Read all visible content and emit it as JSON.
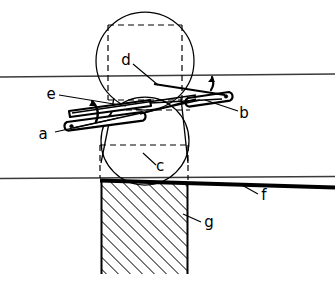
{
  "figure": {
    "background_color": "#ffffff",
    "ink_color": "#000000",
    "width": 335,
    "height": 282,
    "labels": [
      {
        "key": "a",
        "text": "a",
        "x": 45,
        "y": 139,
        "describes": "lower-left lever arm / link with pivot eye"
      },
      {
        "key": "b",
        "text": "b",
        "x": 243,
        "y": 117,
        "describes": "right lever arm / link with pivot eye"
      },
      {
        "key": "c",
        "text": "c",
        "x": 160,
        "y": 170,
        "describes": "lower dashed rectangle inscribed in lower circle"
      },
      {
        "key": "d",
        "text": "d",
        "x": 121,
        "y": 65,
        "describes": "upper dashed rectangle inscribed in upper circle"
      },
      {
        "key": "e",
        "text": "e",
        "x": 50,
        "y": 99,
        "describes": "upper-left lever arm / link"
      },
      {
        "key": "f",
        "text": "f",
        "x": 263,
        "y": 199,
        "describes": "thick horizontal datum line / blade edge"
      },
      {
        "key": "g",
        "text": "g",
        "x": 207,
        "y": 226,
        "describes": "hatched rectangular block / support"
      }
    ],
    "parts": [
      {
        "name": "upper-circle",
        "cx": 145,
        "cy": 61,
        "r": 49
      },
      {
        "name": "lower-circle",
        "cx": 145,
        "cy": 141,
        "r": 44
      },
      {
        "name": "upper-dashed-rectangle",
        "x": 108,
        "y": 25,
        "width": 74,
        "height": 75
      },
      {
        "name": "lower-dashed-rectangle",
        "x": 100,
        "y": 145,
        "width": 88,
        "height": 33
      },
      {
        "name": "band-top-line",
        "x1": 0,
        "y1": 77,
        "x2": 335,
        "y2": 74
      },
      {
        "name": "band-bottom-line",
        "x1": 0,
        "y1": 178,
        "x2": 335,
        "y2": 176
      },
      {
        "name": "thick-datum-line",
        "x1": 100,
        "y1": 180,
        "x2": 335,
        "y2": 187
      },
      {
        "name": "hatched-block",
        "x": 101,
        "y": 181,
        "width": 87,
        "height": 93
      }
    ],
    "annotations": {
      "hatch_angle_deg": 45,
      "hatch_spacing_px": 6,
      "dash_pattern": "6 4",
      "curved_arrows": 2
    }
  }
}
